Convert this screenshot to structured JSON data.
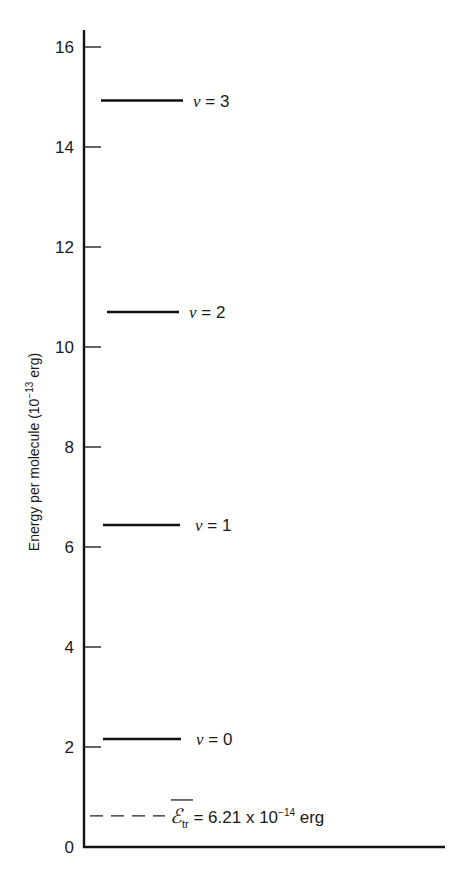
{
  "chart_data": {
    "type": "energy-level-diagram",
    "title": "",
    "xlabel": "",
    "ylabel": "Energy per molecule (10⁻¹³ erg)",
    "ylabel_main": "Energy per molecule (10",
    "ylabel_exp": "−13",
    "ylabel_tail": " erg)",
    "ylim": [
      0,
      16
    ],
    "yticks": [
      0,
      2,
      4,
      6,
      8,
      10,
      12,
      14,
      16
    ],
    "grid": false,
    "levels": [
      {
        "label_var": "v",
        "label_rest": " = 0",
        "value": 2.16
      },
      {
        "label_var": "v",
        "label_rest": " = 1",
        "value": 6.44
      },
      {
        "label_var": "v",
        "label_rest": " = 2",
        "value": 10.7
      },
      {
        "label_var": "v",
        "label_rest": " = 3",
        "value": 14.93
      }
    ],
    "reference_line": {
      "style": "dashed",
      "value": 0.621,
      "symbol": "ℰ",
      "subscript": "tr",
      "text": " = 6.21 x 10",
      "exp": "−14",
      "unit": " erg"
    }
  }
}
